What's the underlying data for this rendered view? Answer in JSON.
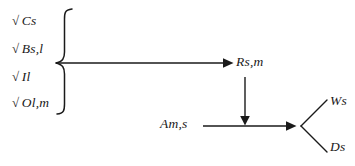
{
  "diagram": {
    "background_color": "#ffffff",
    "stroke_color": "#1a1a1a",
    "reactants": {
      "group_symbol": "brace",
      "items": [
        {
          "id": "cs",
          "radical": "√",
          "label": "Cs"
        },
        {
          "id": "bsl",
          "radical": "√",
          "label": "Bs,l"
        },
        {
          "id": "il",
          "radical": "√",
          "label": "Il"
        },
        {
          "id": "olm",
          "radical": "√",
          "label": "Ol,m"
        }
      ]
    },
    "intermediate": {
      "id": "rsm",
      "label": "Rs,m"
    },
    "secondary_reactant": {
      "id": "ams",
      "label": "Am,s"
    },
    "products": [
      {
        "id": "ws",
        "label": "Ws"
      },
      {
        "id": "ds",
        "label": "Ds"
      }
    ],
    "arrows": [
      {
        "id": "brace-to-rsm",
        "from": "reactant-group",
        "to": "rsm",
        "direction": "right"
      },
      {
        "id": "rsm-to-junction",
        "from": "rsm",
        "to": "junction",
        "direction": "down"
      },
      {
        "id": "ams-to-junction",
        "from": "ams",
        "to": "junction",
        "direction": "right"
      }
    ],
    "branches": [
      {
        "id": "junction-to-ws",
        "from": "junction",
        "to": "ws",
        "direction": "up-right"
      },
      {
        "id": "junction-to-ds",
        "from": "junction",
        "to": "ds",
        "direction": "down-right"
      }
    ]
  }
}
